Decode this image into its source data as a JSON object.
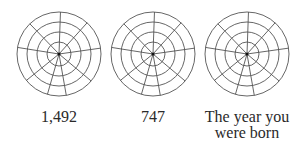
{
  "figure": {
    "style": {
      "stroke": "#555555",
      "background": "#ffffff"
    },
    "wheel_geometry": {
      "ring_radii": [
        12,
        22,
        32,
        42
      ],
      "spoke_angles_deg": [
        88,
        48,
        8,
        -40,
        -80,
        -106,
        -141,
        171,
        134
      ]
    },
    "wheels": [
      {
        "label": "1,492"
      },
      {
        "label": "747"
      },
      {
        "label_line1": "The year you",
        "label_line2": "were born"
      }
    ]
  }
}
